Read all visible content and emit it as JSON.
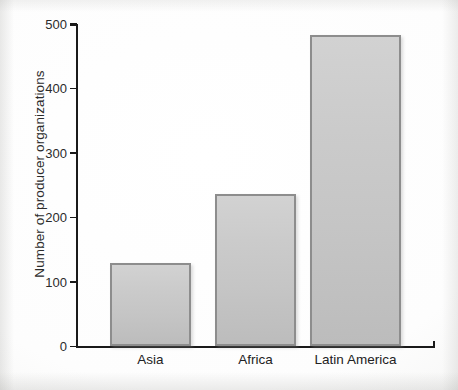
{
  "chart_data": {
    "type": "bar",
    "title": "",
    "xlabel": "",
    "ylabel": "Number of producer organizations",
    "categories": [
      "Asia",
      "Africa",
      "Latin America"
    ],
    "values": [
      129,
      236,
      483
    ],
    "ylim": [
      0,
      500
    ],
    "yticks": [
      0,
      100,
      200,
      300,
      400,
      500
    ],
    "ytick_labels": [
      "0",
      "100",
      "200",
      "300",
      "400",
      "500"
    ],
    "grid": false,
    "legend": null,
    "series": [
      {
        "name": "Number of producer organizations",
        "values": [
          129,
          236,
          483
        ]
      }
    ],
    "colors": {
      "bar_fill": "#c9c9c9",
      "bar_border": "#8d8d8d",
      "axis": "#1a1a1a",
      "text": "#222222",
      "background": "#fdfdfd"
    }
  },
  "axis": {
    "y_title": "Number of producer organizations",
    "ticks": [
      {
        "label": "500",
        "value": 500
      },
      {
        "label": "400",
        "value": 400
      },
      {
        "label": "300",
        "value": 300
      },
      {
        "label": "200",
        "value": 200
      },
      {
        "label": "100",
        "value": 100
      },
      {
        "label": "0",
        "value": 0
      }
    ]
  },
  "bars": [
    {
      "label": "Asia",
      "value": 129
    },
    {
      "label": "Africa",
      "value": 236
    },
    {
      "label": "Latin America",
      "value": 483
    }
  ]
}
